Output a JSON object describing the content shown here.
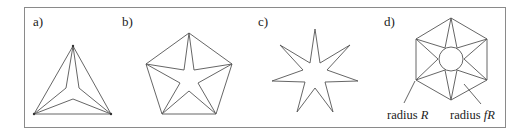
{
  "figure": {
    "panels": [
      {
        "id": "a",
        "label": "a)",
        "description": "triangle with inscribed 3-pointed star"
      },
      {
        "id": "b",
        "label": "b)",
        "description": "pentagon with inscribed 5-pointed star"
      },
      {
        "id": "c",
        "label": "c)",
        "description": "7-pointed star outline"
      },
      {
        "id": "d",
        "label": "d)",
        "description": "hexagon with inscribed 6-pointed star and inner circle",
        "annotations": [
          {
            "prefix": "radius ",
            "symbol": "R"
          },
          {
            "prefix": "radius ",
            "symbol": "fR"
          }
        ]
      }
    ]
  },
  "colors": {
    "frame": "#8a8a8a",
    "stroke": "#555555",
    "text": "#222222"
  }
}
